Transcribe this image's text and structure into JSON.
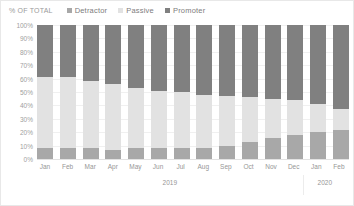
{
  "chart_data": {
    "type": "bar",
    "subtype": "stacked-percentage-column",
    "title": "",
    "ylabel": "% OF TOTAL",
    "xlabel": "",
    "ylim": [
      0,
      100
    ],
    "yticks": [
      "0%",
      "10%",
      "20%",
      "30%",
      "40%",
      "50%",
      "60%",
      "70%",
      "80%",
      "90%",
      "100%"
    ],
    "grid": true,
    "legend_position": "top-left",
    "categories": [
      "Jan",
      "Feb",
      "Mar",
      "Apr",
      "May",
      "Jun",
      "Jul",
      "Aug",
      "Sep",
      "Oct",
      "Nov",
      "Dec",
      "Jan",
      "Feb"
    ],
    "group_labels": [
      {
        "label": "2019",
        "start": 0,
        "count": 12
      },
      {
        "label": "2020",
        "start": 12,
        "count": 2
      }
    ],
    "series": [
      {
        "name": "Detractor",
        "color": "#a8a8a8",
        "values": [
          8,
          8,
          8,
          7,
          8,
          8,
          8,
          8,
          10,
          13,
          16,
          18,
          20,
          22
        ]
      },
      {
        "name": "Passive",
        "color": "#e2e2e2",
        "values": [
          53,
          53,
          50,
          49,
          45,
          43,
          42,
          40,
          37,
          33,
          29,
          26,
          21,
          15
        ]
      },
      {
        "name": "Promoter",
        "color": "#808080",
        "values": [
          39,
          39,
          42,
          44,
          47,
          49,
          50,
          52,
          53,
          54,
          55,
          56,
          59,
          63
        ]
      }
    ]
  },
  "legend": {
    "axis_title": "% OF TOTAL",
    "items": [
      {
        "label": "Detractor",
        "color": "#a8a8a8"
      },
      {
        "label": "Passive",
        "color": "#e2e2e2"
      },
      {
        "label": "Promoter",
        "color": "#808080"
      }
    ]
  }
}
